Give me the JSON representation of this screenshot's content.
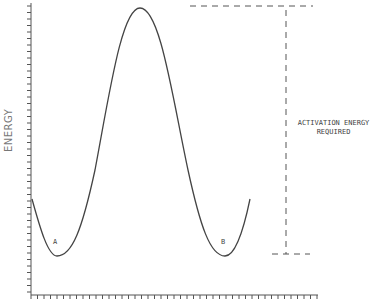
{
  "diagram": {
    "title": "",
    "y_axis_label": "ENERGY",
    "annotation": {
      "line1": "ACTIVATION ENERGY",
      "line2": "REQUIRED"
    },
    "states": [
      {
        "label": "A",
        "position": "left minimum"
      },
      {
        "label": "B",
        "position": "right minimum"
      }
    ],
    "colors": {
      "line": "#444444",
      "axis": "#555555",
      "background": "#ffffff"
    }
  },
  "chart_data": {
    "type": "line",
    "title": "",
    "xlabel": "",
    "ylabel": "ENERGY",
    "points": [
      {
        "x": 0,
        "y": 0.33
      },
      {
        "x": 0.09,
        "y": 0.13
      },
      {
        "x": 0.38,
        "y": 0.98
      },
      {
        "x": 0.67,
        "y": 0.13
      },
      {
        "x": 0.76,
        "y": 0.33
      }
    ],
    "annotations": [
      "A",
      "B",
      "ACTIVATION ENERGY REQUIRED"
    ],
    "grid": false
  }
}
